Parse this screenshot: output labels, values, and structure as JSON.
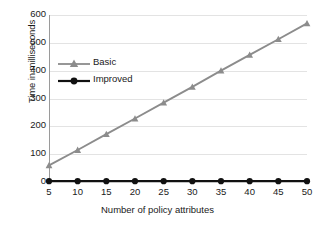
{
  "chart_data": {
    "type": "line",
    "title": "",
    "xlabel": "Number of policy attributes",
    "ylabel": "Time in milliseconds",
    "x": [
      5,
      10,
      15,
      20,
      25,
      30,
      35,
      40,
      45,
      50
    ],
    "xticklabels": [
      "5",
      "10",
      "15",
      "20",
      "25",
      "30",
      "35",
      "40",
      "45",
      "50"
    ],
    "yticklabels": [
      "0",
      "100",
      "200",
      "300",
      "400",
      "500",
      "600"
    ],
    "yticks": [
      0,
      100,
      200,
      300,
      400,
      500,
      600
    ],
    "ylim": [
      0,
      600
    ],
    "xlim": [
      5,
      50
    ],
    "grid": "horizontal",
    "legend_position": "upper-left-inside",
    "series": [
      {
        "name": "Basic",
        "values": [
          60,
          115,
          172,
          228,
          285,
          342,
          400,
          457,
          513,
          570
        ],
        "color": "#8c8c8c",
        "marker": "triangle"
      },
      {
        "name": "Improved",
        "values": [
          3,
          3,
          3,
          3,
          3,
          3,
          3,
          3,
          3,
          3
        ],
        "color": "#111111",
        "marker": "circle"
      }
    ]
  },
  "legend": {
    "items": [
      {
        "label": "Basic"
      },
      {
        "label": "Improved"
      }
    ]
  },
  "colors": {
    "basic": "#8c8c8c",
    "improved": "#111111",
    "gridline": "#e3e3e3",
    "axis": "#9a9a9a",
    "background": "#ffffff",
    "text": "#1a1a1a"
  }
}
